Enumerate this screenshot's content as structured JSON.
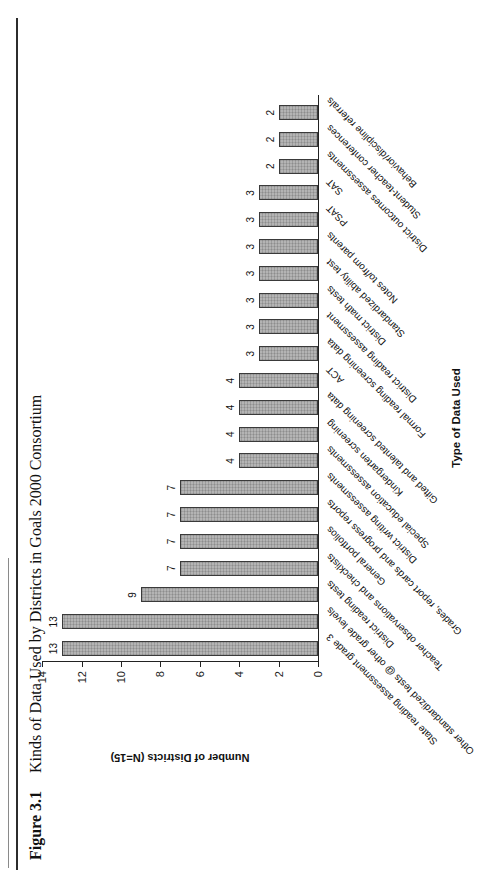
{
  "figure": {
    "label": "Figure 3.1",
    "title": "Kinds of Data Used by Districts in Goals 2000 Consortium"
  },
  "chart_data": {
    "type": "bar",
    "xlabel": "Type of Data Used",
    "ylabel": "Number of Districts (N=15)",
    "ylim": [
      0,
      14
    ],
    "yticks": [
      0,
      2,
      4,
      6,
      8,
      10,
      12,
      14
    ],
    "grid": false,
    "legend": false,
    "bar_color": "#b4b4b4",
    "bar_border_color": "#3a3a3a",
    "categories": [
      "State reading assessment grade 3",
      "Other standardized tests @ other grade levels",
      "District reading tests",
      "Teacher observations and checklists",
      "General portfolios",
      "Grades, report cards and progress reports",
      "District writing assessments",
      "Special education assessments",
      "Kindergarten screening",
      "Gifted and talented screening data",
      "ACT",
      "Formal reading screening data",
      "District reading assessment",
      "District math tests",
      "Standardized ability test",
      "Notes to/from parents",
      "PSAT",
      "SAT",
      "District outcomes assessments",
      "Student-teacher conferences",
      "Behavior/discipline referrals"
    ],
    "values": [
      13,
      13,
      9,
      7,
      7,
      7,
      7,
      4,
      4,
      4,
      4,
      3,
      3,
      3,
      3,
      3,
      3,
      3,
      2,
      2,
      2
    ]
  }
}
